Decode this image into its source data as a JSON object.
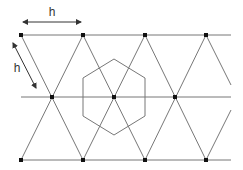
{
  "diagram": {
    "labels": {
      "horizontal_spacing": "h",
      "diagonal_spacing": "h"
    },
    "colors": {
      "line": "#777777",
      "dot": "#111111",
      "arrow": "#333333",
      "background": "#ffffff"
    },
    "rows": {
      "top_y": 35,
      "middle_y": 97,
      "bottom_y": 160
    },
    "nodes": {
      "top": [
        [
          21,
          35
        ],
        [
          83,
          35
        ],
        [
          145,
          35
        ],
        [
          206,
          35
        ]
      ],
      "middle": [
        [
          52,
          97
        ],
        [
          114,
          97
        ],
        [
          175,
          97
        ]
      ],
      "bottom": [
        [
          21,
          160
        ],
        [
          83,
          160
        ],
        [
          145,
          160
        ],
        [
          206,
          160
        ]
      ]
    },
    "hexagon": {
      "center": [
        114,
        97
      ],
      "vertices": [
        [
          114,
          59
        ],
        [
          145,
          78
        ],
        [
          145,
          116
        ],
        [
          114,
          135
        ],
        [
          83,
          116
        ],
        [
          83,
          78
        ]
      ]
    }
  }
}
